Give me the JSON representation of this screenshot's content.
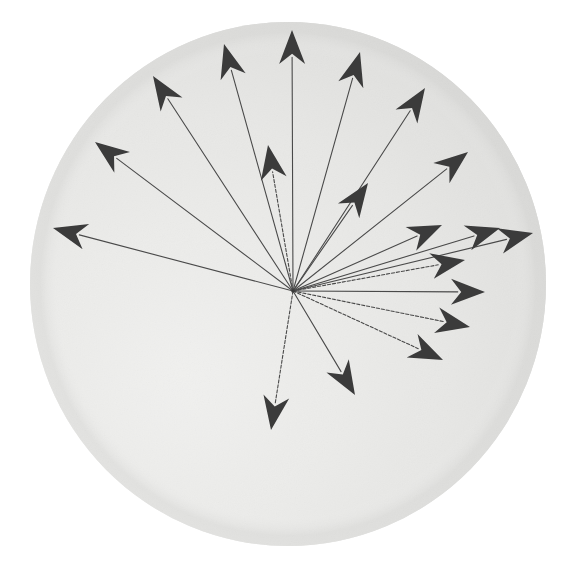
{
  "figure": {
    "title": "Radial vector diagram on shaded sphere",
    "kind": "vector-field",
    "canvas_width": 573,
    "canvas_height": 570,
    "background_color": "#ffffff"
  },
  "disc": {
    "name": "shaded-sphere",
    "center_x": 288,
    "center_y": 284,
    "radius_x": 258,
    "radius_y": 262,
    "fill_light": "#f2f2f0",
    "fill_mid": "#e3e3e1",
    "fill_dark": "#cfcfcd",
    "edge_color": "#c6c6c4",
    "highlight_x": 175,
    "highlight_y": 370
  },
  "origin": {
    "name": "vector-origin",
    "x": 293,
    "y": 291,
    "label": ""
  },
  "style": {
    "shaft_color": "#4a4a4a",
    "shaft_width": 1.1,
    "head_color": "#3b3b3b",
    "head_length": 34,
    "head_half_width": 13
  },
  "chart_data": {
    "type": "vector",
    "title": "Radial vector diagram on shaded sphere",
    "xlabel": "",
    "ylabel": "",
    "origin": [
      293,
      291
    ],
    "note": "All vectors share a single origin; lengths and angles read off the scanned figure. Angle is measured in degrees counter-clockwise from the +x axis (screen-up positive).",
    "vectors": [
      {
        "id": "v01",
        "tip_x": 292,
        "tip_y": 30,
        "angle_deg": 89.8,
        "length": 261,
        "style": "solid"
      },
      {
        "id": "v02",
        "tip_x": 224,
        "tip_y": 44,
        "angle_deg": 107.2,
        "length": 258,
        "style": "solid"
      },
      {
        "id": "v03",
        "tip_x": 153,
        "tip_y": 76,
        "angle_deg": 123.7,
        "length": 259,
        "style": "solid"
      },
      {
        "id": "v04",
        "tip_x": 95,
        "tip_y": 142,
        "angle_deg": 143.2,
        "length": 248,
        "style": "solid"
      },
      {
        "id": "v05",
        "tip_x": 53,
        "tip_y": 228,
        "angle_deg": 164.7,
        "length": 249,
        "style": "solid"
      },
      {
        "id": "v06",
        "tip_x": 268,
        "tip_y": 145,
        "angle_deg": 99.7,
        "length": 148,
        "style": "dashed"
      },
      {
        "id": "v07",
        "tip_x": 360,
        "tip_y": 52,
        "angle_deg": 72.6,
        "length": 250,
        "style": "solid"
      },
      {
        "id": "v08",
        "tip_x": 425,
        "tip_y": 88,
        "angle_deg": 59.6,
        "length": 236,
        "style": "solid"
      },
      {
        "id": "v09",
        "tip_x": 368,
        "tip_y": 183,
        "angle_deg": 55.2,
        "length": 132,
        "style": "solid"
      },
      {
        "id": "v10",
        "tip_x": 468,
        "tip_y": 152,
        "angle_deg": 44.3,
        "length": 244,
        "style": "solid"
      },
      {
        "id": "v11",
        "tip_x": 533,
        "tip_y": 233,
        "angle_deg": 13.6,
        "length": 247,
        "style": "solid"
      },
      {
        "id": "v12",
        "tip_x": 442,
        "tip_y": 225,
        "angle_deg": 23.9,
        "length": 163,
        "style": "solid"
      },
      {
        "id": "v13",
        "tip_x": 465,
        "tip_y": 260,
        "angle_deg": 10.2,
        "length": 175,
        "style": "dashed"
      },
      {
        "id": "v14",
        "tip_x": 485,
        "tip_y": 292,
        "angle_deg": -0.3,
        "length": 192,
        "style": "solid"
      },
      {
        "id": "v15",
        "tip_x": 470,
        "tip_y": 327,
        "angle_deg": -11.5,
        "length": 181,
        "style": "dashed"
      },
      {
        "id": "v16",
        "tip_x": 443,
        "tip_y": 360,
        "angle_deg": -21.5,
        "length": 161,
        "style": "dashed"
      },
      {
        "id": "v17",
        "tip_x": 355,
        "tip_y": 395,
        "angle_deg": -59.2,
        "length": 121,
        "style": "solid"
      },
      {
        "id": "v18",
        "tip_x": 271,
        "tip_y": 430,
        "angle_deg": -99.5,
        "length": 141,
        "style": "dashed"
      },
      {
        "id": "v19",
        "tip_x": 500,
        "tip_y": 228,
        "angle_deg": 17.9,
        "length": 218,
        "style": "solid"
      }
    ]
  }
}
